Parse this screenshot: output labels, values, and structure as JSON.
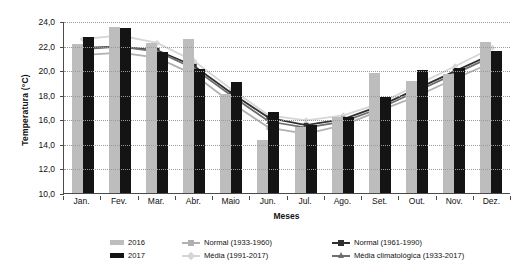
{
  "chart_data": {
    "type": "bar",
    "title": "",
    "xlabel": "Meses",
    "ylabel": "Temperatura (°C)",
    "ylim": [
      10.0,
      24.0
    ],
    "ytick_step": 2.0,
    "grid": true,
    "legend_position": "bottom",
    "categories": [
      "Jan.",
      "Fev.",
      "Mar.",
      "Abr.",
      "Maio",
      "Jun.",
      "Jul.",
      "Ago.",
      "Set.",
      "Out.",
      "Nov.",
      "Dez."
    ],
    "ytick_labels": [
      "24,0",
      "22,0",
      "20,0",
      "18,0",
      "16,0",
      "14,0",
      "12,0",
      "10,0"
    ],
    "ytick_values": [
      24.0,
      22.0,
      20.0,
      18.0,
      16.0,
      14.0,
      12.0,
      10.0
    ],
    "bar_series": [
      {
        "name": "2016",
        "color": "#bdbdbd",
        "values": [
          22.1,
          23.5,
          22.2,
          22.5,
          18.1,
          14.3,
          15.4,
          16.2,
          19.8,
          19.1,
          19.7,
          22.3
        ]
      },
      {
        "name": "2017",
        "color": "#141414",
        "values": [
          22.7,
          23.4,
          21.5,
          20.1,
          19.0,
          16.6,
          15.5,
          16.2,
          17.8,
          20.0,
          20.2,
          21.6
        ]
      }
    ],
    "line_series": [
      {
        "name": "Normal (1933-1960)",
        "color": "#b0b0b0",
        "marker": "square",
        "values": [
          21.3,
          21.5,
          21.1,
          19.7,
          17.4,
          15.4,
          14.9,
          15.6,
          16.8,
          18.0,
          19.4,
          20.7
        ]
      },
      {
        "name": "Média (1991-2017)",
        "color": "#d6d6d6",
        "marker": "diamond",
        "values": [
          22.6,
          22.9,
          22.3,
          20.8,
          18.5,
          16.4,
          16.0,
          16.4,
          17.4,
          18.9,
          20.4,
          21.9
        ]
      },
      {
        "name": "Normal (1961-1990)",
        "color": "#303030",
        "marker": "square",
        "values": [
          21.9,
          22.0,
          21.7,
          20.4,
          18.2,
          16.2,
          15.6,
          16.1,
          17.2,
          18.6,
          20.0,
          21.4
        ]
      },
      {
        "name": "Média climatológica (1933-2017)",
        "color": "#6e6e6e",
        "marker": "triangle",
        "values": [
          21.8,
          22.0,
          21.6,
          20.2,
          18.0,
          15.9,
          15.4,
          15.9,
          17.0,
          18.4,
          19.8,
          21.2
        ]
      }
    ]
  },
  "axis": {
    "y_title": "Temperatura (°C)",
    "x_title": "Meses"
  },
  "legend": {
    "items": [
      {
        "label": "2016",
        "type": "bar",
        "color": "#bdbdbd"
      },
      {
        "label": "Normal (1933-1960)",
        "type": "line",
        "color": "#b0b0b0",
        "marker": "square"
      },
      {
        "label": "Normal (1961-1990)",
        "type": "line",
        "color": "#303030",
        "marker": "square"
      },
      {
        "label": "2017",
        "type": "bar",
        "color": "#141414"
      },
      {
        "label": "Média (1991-2017)",
        "type": "line",
        "color": "#d6d6d6",
        "marker": "diamond"
      },
      {
        "label": "Média climatológica (1933-2017)",
        "type": "line",
        "color": "#6e6e6e",
        "marker": "triangle"
      }
    ]
  }
}
